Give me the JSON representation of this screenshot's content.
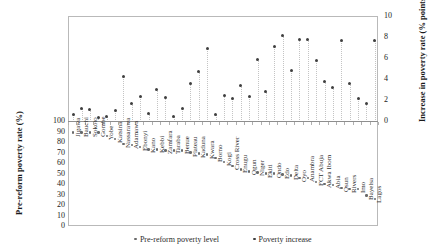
{
  "chart_data": {
    "type": "scatter",
    "title": "",
    "categories": [
      "Jigawa",
      "Bauchi",
      "Sokoto",
      "Gombe",
      "Yobe",
      "Katsina",
      "Nassarawa",
      "Adamawa",
      "Ebonyi",
      "Kano",
      "Kebbi",
      "Zamfara",
      "Taraba",
      "Benue",
      "Plateau",
      "Kaduna",
      "Kwara",
      "Borno",
      "Kogi",
      "Cross River",
      "Enugu",
      "Ogun",
      "Niger",
      "Ekiti",
      "Ondo",
      "Edo",
      "Delta",
      "Oyo",
      "Anambra",
      "FCT Abuja",
      "Akwa Ibom",
      "Abia",
      "Osun",
      "Rivers",
      "Imo",
      "Bayelsa",
      "Lagos"
    ],
    "series": [
      {
        "name": "Pre-reform poverty level",
        "axis": "left",
        "ylabel": "Pre-reform poverty rate (%)",
        "ylim": [
          0,
          100
        ],
        "values": [
          89,
          89,
          89,
          89,
          86,
          83,
          78,
          77,
          75,
          73,
          73,
          72,
          72,
          72,
          70,
          69,
          68,
          65,
          61,
          57,
          54,
          52,
          51,
          50,
          50,
          49,
          48,
          46,
          46,
          42,
          40,
          39,
          36,
          35,
          35,
          29,
          26
        ]
      },
      {
        "name": "Poverty increase",
        "axis": "right",
        "ylabel": "Increase in poverty rate (% points)",
        "ylim": [
          0,
          10
        ],
        "values": [
          0.7,
          1.3,
          1.2,
          0.4,
          0.5,
          1.1,
          4.3,
          1.8,
          2.4,
          0.8,
          3.1,
          2.3,
          0.5,
          1.3,
          3.7,
          4.8,
          7.0,
          0.7,
          2.5,
          2.2,
          3.5,
          2.4,
          6.0,
          2.9,
          7.2,
          8.2,
          4.9,
          7.9,
          7.9,
          5.9,
          3.9,
          3.3,
          7.8,
          3.7,
          2.2,
          1.8,
          7.8
        ]
      }
    ],
    "left_axis": {
      "label": "Pre-reform poverty rate (%)",
      "ticks": [
        "100",
        "90",
        "80",
        "70",
        "60",
        "50",
        "40",
        "30",
        "20",
        "10",
        "0"
      ],
      "min": 0,
      "max": 100
    },
    "right_axis": {
      "label": "Increase in poverty rate (% points)",
      "ticks": [
        "10",
        "8",
        "6",
        "4",
        "2",
        "0"
      ],
      "min": 0,
      "max": 10
    },
    "xlabel": "",
    "grid": false,
    "legend_position": "bottom",
    "legend": [
      "Pre-reform poverty level",
      "Poverty increase"
    ]
  }
}
